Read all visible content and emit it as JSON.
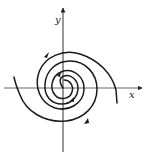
{
  "diagram": {
    "type": "phase-portrait-spiral",
    "axes": {
      "x_label": "x",
      "y_label": "y"
    },
    "colors": {
      "stroke": "#1a1a1a",
      "axis": "#333333",
      "background": "#ffffff"
    },
    "trajectories": [
      {
        "name": "spiral-a",
        "direction": "outward",
        "end": "left"
      },
      {
        "name": "spiral-b",
        "direction": "outward",
        "end": "right"
      }
    ]
  }
}
